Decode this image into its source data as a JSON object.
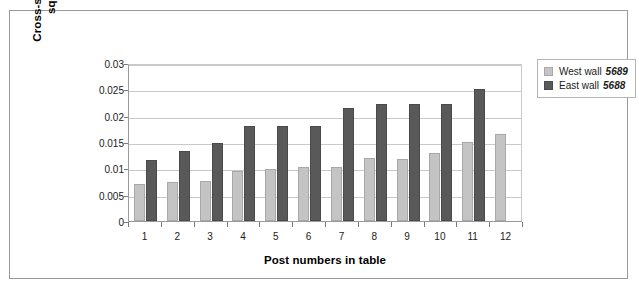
{
  "chart_data": {
    "type": "bar",
    "title": "",
    "xlabel": "Post numbers in table",
    "ylabel": "Cross-sectional areas in square metres",
    "ylabel_lines": [
      "Cross-sectional areas in",
      "square metres"
    ],
    "categories": [
      "1",
      "2",
      "3",
      "4",
      "5",
      "6",
      "7",
      "8",
      "9",
      "10",
      "11",
      "12"
    ],
    "ylim": [
      0,
      0.03
    ],
    "ytick_labels": [
      "0",
      "0.005",
      "0.01",
      "0.015",
      "0.02",
      "0.025",
      "0.03"
    ],
    "ytick_values": [
      0,
      0.005,
      0.01,
      0.015,
      0.02,
      0.025,
      0.03
    ],
    "grid": true,
    "legend_position": "right",
    "series": [
      {
        "name": "West wall",
        "code": "5689",
        "color": "#c4c4c4",
        "values": [
          0.007,
          0.0075,
          0.0076,
          0.0095,
          0.0099,
          0.0103,
          0.0103,
          0.012,
          0.0118,
          0.013,
          0.015,
          0.0165
        ]
      },
      {
        "name": "East wall",
        "code": "5688",
        "color": "#595959",
        "values": [
          0.0115,
          0.0133,
          0.0149,
          0.018,
          0.018,
          0.018,
          0.0215,
          0.0222,
          0.0222,
          0.0222,
          0.025,
          null
        ]
      }
    ]
  },
  "colors": {
    "west_wall": "#c4c4c4",
    "east_wall": "#595959",
    "gridline": "#c9c9c9",
    "axis": "#9a9a9a",
    "frame": "#9a9a9a",
    "text": "#1a1a1a"
  }
}
